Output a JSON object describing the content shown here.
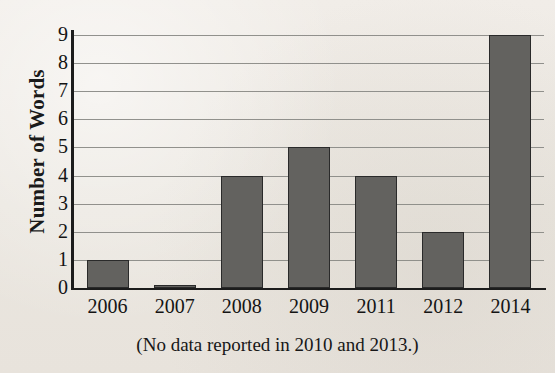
{
  "chart_data": {
    "type": "bar",
    "title": "",
    "xlabel": "",
    "ylabel": "Number of Words",
    "categories": [
      "2006",
      "2007",
      "2008",
      "2009",
      "2011",
      "2012",
      "2014"
    ],
    "values": [
      1,
      0.1,
      4,
      5,
      4,
      2,
      9
    ],
    "ylim": [
      0,
      9
    ],
    "ytick_labels": [
      "9",
      "8",
      "7",
      "6",
      "5",
      "4",
      "3",
      "2",
      "1",
      "0"
    ],
    "ytick_values": [
      9,
      8,
      7,
      6,
      5,
      4,
      3,
      2,
      1,
      0
    ],
    "grid": true,
    "legend": "none",
    "caption": "(No data reported in 2010 and 2013.)",
    "bar_color": "#63625f",
    "bar_edge_color": "#2a2a2a",
    "grid_color": "#8b8b87",
    "axis_color": "#1c1c1c",
    "background_color": "#eeeae4"
  }
}
